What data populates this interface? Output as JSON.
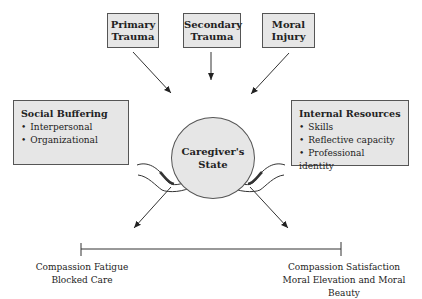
{
  "top_boxes": [
    {
      "line1": "Primary",
      "line2": "Trauma"
    },
    {
      "line1": "Secondary",
      "line2": "Trauma"
    },
    {
      "line1": "Moral",
      "line2": "Injury"
    }
  ],
  "center": {
    "line1": "Caregiver's",
    "line2": "State"
  },
  "left_box": {
    "title": "Social Buffering",
    "items": [
      "Interpersonal",
      "Organizational"
    ]
  },
  "right_box": {
    "title": "Internal Resources",
    "items": [
      "Skills",
      "Reflective capacity",
      "Professional identity"
    ]
  },
  "scale": {
    "left": {
      "line1": "Compassion Fatigue",
      "line2": "Blocked Care"
    },
    "right": {
      "line1": "Compassion Satisfaction",
      "line2": "Moral Elevation and Moral Beauty"
    }
  }
}
